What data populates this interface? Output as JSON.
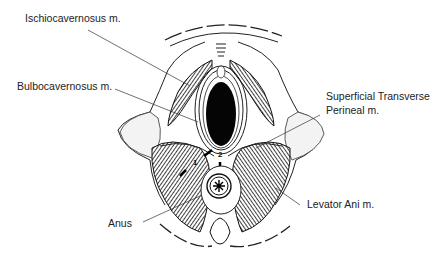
{
  "figure": {
    "labels": {
      "ischiocavernosus": "Ischiocavernosus m.",
      "bulbocavernosus": "Bulbocavernosus m.",
      "superficial_transverse_1": "Superficial Transverse",
      "superficial_transverse_2": "Perineal  m.",
      "anus": "Anus",
      "levator_ani": "Levator Ani m."
    },
    "markers": {
      "one": "1",
      "two": "2"
    }
  }
}
